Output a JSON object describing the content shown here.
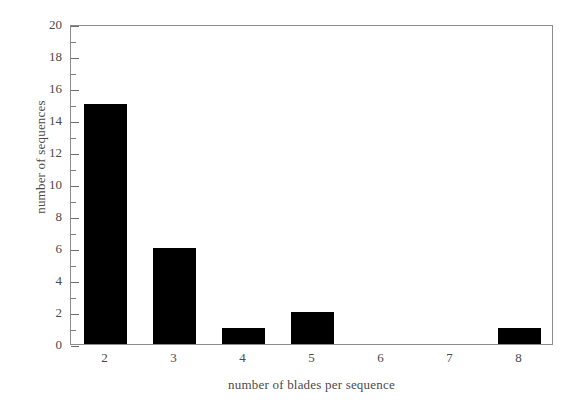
{
  "chart_data": {
    "type": "bar",
    "title": "",
    "subtitle": "",
    "xlabel": "number of blades per sequence",
    "ylabel": "number of sequences",
    "categories": [
      "2",
      "3",
      "4",
      "5",
      "6",
      "7",
      "8"
    ],
    "values": [
      15,
      6,
      1,
      2,
      0,
      0,
      1
    ],
    "series": [
      {
        "name": "number of sequences",
        "values": [
          15,
          6,
          1,
          2,
          0,
          0,
          1
        ]
      }
    ],
    "xlim": [
      1.5,
      8.5
    ],
    "ylim": [
      0,
      20
    ],
    "ytick_labels": [
      "0",
      "2",
      "4",
      "6",
      "8",
      "10",
      "12",
      "14",
      "16",
      "18",
      "20"
    ],
    "ytick_values": [
      0,
      2,
      4,
      6,
      8,
      10,
      12,
      14,
      16,
      18,
      20
    ],
    "yminor_values": [
      1,
      3,
      5,
      7,
      9,
      11,
      13,
      15,
      17,
      19
    ],
    "xtick_labels": [
      "2",
      "3",
      "4",
      "5",
      "6",
      "7",
      "8"
    ],
    "grid": false,
    "legend": false,
    "legend_position": "none",
    "bar_color": "#000000",
    "frame_color": "#8c8c8c",
    "text_color": "#4a4a4a",
    "background": "#ffffff",
    "annotations": []
  }
}
